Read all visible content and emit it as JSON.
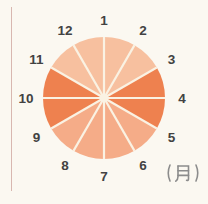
{
  "figure": {
    "background_color": "#fbf8f1",
    "left_rule_color": "#cfa6a0"
  },
  "chart_data": {
    "type": "pie",
    "title": "",
    "unit_label": "(月)",
    "labels": [
      "1",
      "2",
      "3",
      "4",
      "5",
      "6",
      "7",
      "8",
      "9",
      "10",
      "11",
      "12"
    ],
    "label_angles_deg": [
      90,
      60,
      30,
      0,
      -30,
      -60,
      -90,
      -120,
      -150,
      180,
      150,
      120
    ],
    "slices": [
      {
        "from": "1",
        "to": "2",
        "angle_deg": 30,
        "shade": "light"
      },
      {
        "from": "2",
        "to": "3",
        "angle_deg": 30,
        "shade": "light"
      },
      {
        "from": "3",
        "to": "4",
        "angle_deg": 30,
        "shade": "dark"
      },
      {
        "from": "4",
        "to": "5",
        "angle_deg": 30,
        "shade": "dark"
      },
      {
        "from": "5",
        "to": "6",
        "angle_deg": 30,
        "shade": "medium"
      },
      {
        "from": "6",
        "to": "7",
        "angle_deg": 30,
        "shade": "medium"
      },
      {
        "from": "7",
        "to": "8",
        "angle_deg": 30,
        "shade": "medium"
      },
      {
        "from": "8",
        "to": "9",
        "angle_deg": 30,
        "shade": "medium"
      },
      {
        "from": "9",
        "to": "10",
        "angle_deg": 30,
        "shade": "dark"
      },
      {
        "from": "10",
        "to": "11",
        "angle_deg": 30,
        "shade": "dark"
      },
      {
        "from": "11",
        "to": "12",
        "angle_deg": 30,
        "shade": "light"
      },
      {
        "from": "12",
        "to": "1",
        "angle_deg": 30,
        "shade": "light"
      }
    ],
    "shade_colors": {
      "light": "#f7c09f",
      "medium": "#f5ac88",
      "dark": "#ee814f"
    },
    "divider_color": "#faf2e3",
    "label_color": "#424242",
    "unit_label_color": "#8c8c8c",
    "geometry": {
      "cx": 104,
      "cy": 98,
      "radius": 61,
      "label_radius": 78,
      "spoke_width": 2.2,
      "center_dot_radius": 4
    },
    "legend": "none",
    "grid": "off"
  }
}
